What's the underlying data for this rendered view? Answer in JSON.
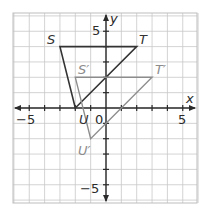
{
  "diagram": {
    "type": "coordinate-plane-translation",
    "x_axis_label": "x",
    "y_axis_label": "y",
    "origin_label": "0",
    "tick_labels": {
      "x_neg5": "−5",
      "x_pos5": "5",
      "y_pos5": "5",
      "y_neg5": "−5"
    },
    "range": {
      "xmin": -6,
      "xmax": 6,
      "ymin": -6,
      "ymax": 6
    },
    "colors": {
      "grid": "#c8c8c8",
      "axis": "#2b2b2b",
      "original": "#333333",
      "image": "#8c8c8c",
      "background": "#ffffff"
    },
    "original_triangle": {
      "name": "STU",
      "vertices": [
        {
          "label": "S",
          "x": -3,
          "y": 4
        },
        {
          "label": "T",
          "x": 2,
          "y": 4
        },
        {
          "label": "U",
          "x": -2,
          "y": 0
        }
      ]
    },
    "image_triangle": {
      "name": "S'T'U'",
      "vertices": [
        {
          "label": "S′",
          "x": -2,
          "y": 2
        },
        {
          "label": "T′",
          "x": 3,
          "y": 2
        },
        {
          "label": "U′",
          "x": -1,
          "y": -2
        }
      ]
    }
  }
}
